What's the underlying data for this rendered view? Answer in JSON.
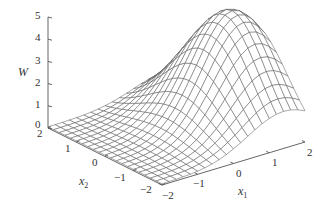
{
  "chart_data": {
    "type": "surface3d",
    "title": "",
    "xlabel": "x1",
    "ylabel": "x2",
    "zlabel": "W",
    "x1_ticks": [
      -2,
      -1,
      0,
      1,
      2
    ],
    "x2_ticks": [
      2,
      1,
      0,
      -1,
      -2
    ],
    "z_ticks": [
      0,
      1,
      2,
      3,
      4,
      5
    ],
    "x1_range": [
      -2,
      2
    ],
    "x2_range": [
      -2,
      2
    ],
    "zlim": [
      0,
      5
    ],
    "grid_resolution": 21,
    "surface_description": "Single smooth peak reaching about 5 near x1≈1.4, x2≈-0.2; surface decays toward ~0 at x1=-2 and along far edges",
    "peak": {
      "x1": 1.4,
      "x2": -0.2,
      "W": 5.0
    },
    "model": {
      "amplitude": 5.0,
      "center_x1": 1.4,
      "center_x2": -0.2,
      "sigma_x1": 1.0,
      "sigma_x2": 1.2,
      "baseline": 0.05
    },
    "line_color": "#555555",
    "axis_color": "#555555"
  },
  "labels": {
    "z_axis": "W",
    "x1_axis": "x",
    "x1_sub": "1",
    "x2_axis": "x",
    "x2_sub": "2",
    "z_ticks": [
      "5",
      "4",
      "3",
      "2",
      "1",
      "0"
    ],
    "x2_ticks": [
      "2",
      "1",
      "0",
      "−1",
      "−2"
    ],
    "x1_ticks": [
      "−2",
      "−1",
      "0",
      "1",
      "2"
    ]
  }
}
